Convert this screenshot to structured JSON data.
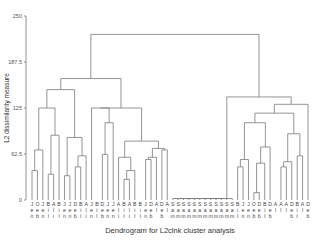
{
  "chart_data": {
    "type": "dendrogram",
    "title": "Dendrogram for L2clnk cluster analysis",
    "xlabel": "Dendrogram for L2clnk cluster analysis",
    "ylabel": "L2 dissimilarity measure",
    "ylim": [
      0,
      250
    ],
    "yticks": [
      "0",
      "62.5",
      "125",
      "187.5",
      "250"
    ],
    "ytick_values": [
      0,
      62.5,
      125,
      187.5,
      250
    ],
    "leaf_labels": [
      [
        "J",
        "e",
        "n"
      ],
      [
        "O",
        "e",
        "b"
      ],
      [
        "J",
        "e",
        "n"
      ],
      [
        "B",
        "i",
        "l"
      ],
      [
        "A",
        "l",
        "i"
      ],
      [
        "B",
        "i",
        "l"
      ],
      [
        "J",
        "e",
        "n"
      ],
      [
        "J",
        "e",
        "n"
      ],
      [
        "D",
        "e",
        "b"
      ],
      [
        "B",
        "i",
        "l"
      ],
      [
        "A",
        "l",
        "i"
      ],
      [
        "J",
        "e",
        "n"
      ],
      [
        "B",
        "i",
        "l"
      ],
      [
        "D",
        "e",
        "b"
      ],
      [
        "J",
        "e",
        "n"
      ],
      [
        "J",
        "e",
        "n"
      ],
      [
        "A",
        "l",
        "i"
      ],
      [
        "B",
        "i",
        "l"
      ],
      [
        "A",
        "l",
        "i"
      ],
      [
        "B",
        "i",
        "l"
      ],
      [
        "B",
        "i",
        "l"
      ],
      [
        "J",
        "e",
        "n"
      ],
      [
        "D",
        "e",
        "b"
      ],
      [
        "A",
        "l",
        ""
      ],
      [
        "D",
        "e",
        "b"
      ],
      [
        "A",
        "l",
        ""
      ],
      [
        "S",
        "a",
        "m"
      ],
      [
        "S",
        "a",
        "m"
      ],
      [
        "S",
        "a",
        "m"
      ],
      [
        "S",
        "a",
        "m"
      ],
      [
        "S",
        "a",
        "m"
      ],
      [
        "S",
        "a",
        "m"
      ],
      [
        "S",
        "a",
        "m"
      ],
      [
        "S",
        "a",
        "m"
      ],
      [
        "S",
        "a",
        "m"
      ],
      [
        "S",
        "a",
        "m"
      ],
      [
        "S",
        "a",
        "m"
      ],
      [
        "S",
        "a",
        "m"
      ],
      [
        "B",
        "i",
        "l"
      ],
      [
        "J",
        "e",
        "n"
      ],
      [
        "J",
        "e",
        "n"
      ],
      [
        "O",
        "e",
        "b"
      ],
      [
        "D",
        "e",
        "b"
      ],
      [
        "B",
        "i",
        "l"
      ],
      [
        "D",
        "e",
        "b"
      ],
      [
        "A",
        "l",
        ""
      ],
      [
        "A",
        "l",
        ""
      ],
      [
        "A",
        "l",
        ""
      ],
      [
        "D",
        "e",
        "b"
      ],
      [
        "B",
        "i",
        "l"
      ],
      [
        "A",
        "l",
        ""
      ],
      [
        "D",
        "e",
        "b"
      ]
    ],
    "grid": false,
    "legend": "none"
  },
  "axis": {
    "y_title": "L2 dissimilarity measure",
    "x_title": "Dendrogram for L2clnk cluster analysis"
  }
}
